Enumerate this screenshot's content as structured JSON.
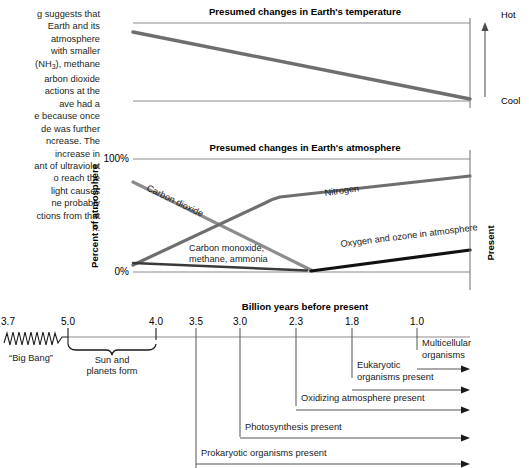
{
  "body_text": "g suggests that\nEarth and its\natmosphere\nwith smaller\n(NH3), methane\narbon dioxide\nactions at the\nave had a\ne because once\nde was further\nncrease. The\nincrease in\nant of ultraviolet\no reach the\n light causes\nne probably\nctions from that\nh.",
  "colors": {
    "axis": "#8b8b8b",
    "co2_line": "#8c8c8c",
    "nitrogen_line": "#6e6e6e",
    "oxygen_line": "#111111",
    "methane_line": "#3a3a3a",
    "temperature_line": "#6e6e6e",
    "event_line": "#555555",
    "text": "#1a1a1a"
  },
  "temperature_chart": {
    "title": "Presumed changes in Earth's temperature",
    "right_axis_top_label": "Hot",
    "right_axis_bottom_label": "Cool"
  },
  "atmosphere_chart": {
    "title": "Presumed changes in Earth's atmosphere",
    "y_axis_label": "Percent of atmosphere",
    "y_tick_top": "100%",
    "y_tick_bottom": "0%",
    "right_axis_label": "Present",
    "series": [
      {
        "name": "Carbon dioxide",
        "label": "Carbon dioxide"
      },
      {
        "name": "Nitrogen",
        "label": "Nitrogen"
      },
      {
        "name": "Carbon monoxide, methane, ammonia",
        "label_line1": "Carbon monoxide,",
        "label_line2": "methane, ammonia"
      },
      {
        "name": "Oxygen and ozone",
        "label": "Oxygen and ozone in atmosphere"
      }
    ]
  },
  "timeline": {
    "axis_title": "Billion years before present",
    "ticks": [
      "3.7",
      "5.0",
      "4.0",
      "3.5",
      "3.0",
      "2.3",
      "1.8",
      "1.0"
    ],
    "big_bang_label": "“Big Bang”",
    "formation_label_line1": "Sun and",
    "formation_label_line2": "planets form"
  },
  "events": [
    {
      "label": "Multicellular organisms",
      "label_line1": "Multicellular",
      "label_line2": "organisms",
      "start_tick": "1.0"
    },
    {
      "label": "Eukaryotic organisms present",
      "label_line1": "Eukaryotic",
      "label_line2": "organisms present",
      "start_tick": "1.8"
    },
    {
      "label": "Oxidizing atmosphere present",
      "label_line1": "Oxidizing atmosphere present",
      "label_line2": "",
      "start_tick": "2.3"
    },
    {
      "label": "Photosynthesis present",
      "label_line1": "Photosynthesis present",
      "label_line2": "",
      "start_tick": "3.0"
    },
    {
      "label": "Prokaryotic organisms present",
      "label_line1": "Prokaryotic organisms present",
      "label_line2": "",
      "start_tick": "3.5"
    }
  ],
  "chart_data": {
    "type": "line",
    "xlabel": "Billion years before present",
    "ylabel": "Percent of atmosphere",
    "x_ticks": [
      5.0,
      4.0,
      3.5,
      3.0,
      2.3,
      1.8,
      1.0
    ],
    "x_axis_direction": "decreasing-left-to-right",
    "ylim": [
      0,
      100
    ],
    "grid": false,
    "legend": "inline-labels",
    "panels": [
      {
        "name": "Presumed changes in Earth's temperature",
        "ylabel_top": "Hot",
        "ylabel_bottom": "Cool",
        "series": [
          {
            "name": "Temperature",
            "x": [
              4.35,
              1.0
            ],
            "y": [
              95,
              2
            ],
            "note": "declines steadily from hot to cool"
          }
        ]
      },
      {
        "name": "Presumed changes in Earth's atmosphere",
        "ylabel": "Percent of atmosphere",
        "series": [
          {
            "name": "Carbon dioxide",
            "x": [
              4.35,
              2.55
            ],
            "y": [
              78,
              0
            ],
            "note": "falls from high to near zero"
          },
          {
            "name": "Nitrogen",
            "x": [
              4.35,
              3.1,
              1.0
            ],
            "y": [
              6,
              55,
              92
            ],
            "note": "rises steeply then levels to dominant fraction"
          },
          {
            "name": "Carbon monoxide, methane, ammonia",
            "x": [
              4.35,
              2.5
            ],
            "y": [
              6,
              1
            ],
            "note": "small fraction declining to near zero"
          },
          {
            "name": "Oxygen and ozone in atmosphere",
            "x": [
              2.5,
              1.0
            ],
            "y": [
              0,
              20
            ],
            "note": "begins after carbon dioxide depletion and rises"
          }
        ]
      }
    ],
    "event_bars": [
      {
        "label": "Prokaryotic organisms present",
        "start": 3.5,
        "end": 1.0
      },
      {
        "label": "Photosynthesis present",
        "start": 3.0,
        "end": 1.0
      },
      {
        "label": "Oxidizing atmosphere present",
        "start": 2.3,
        "end": 1.0
      },
      {
        "label": "Eukaryotic organisms present",
        "start": 1.8,
        "end": 1.0
      },
      {
        "label": "Multicellular organisms",
        "start": 1.0,
        "end": 1.0
      }
    ]
  }
}
